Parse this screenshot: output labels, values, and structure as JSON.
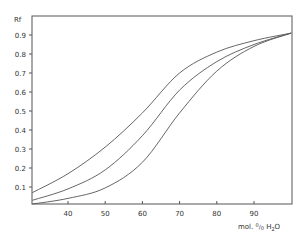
{
  "chart_data": {
    "type": "line",
    "title": "",
    "xlabel": "mol. % H2O",
    "xlabel_display": {
      "pre": "mol. ",
      "percent_top": "0",
      "percent_bottom": "0",
      "post": " H",
      "sub": "2",
      "end": "O"
    },
    "ylabel": "Rf",
    "xlim": [
      30.4,
      100
    ],
    "ylim": [
      0,
      1.0
    ],
    "x_ticks": [
      40,
      50,
      60,
      70,
      80,
      90
    ],
    "x_tick_labels": [
      "40",
      "50",
      "60",
      "70",
      "80",
      "90"
    ],
    "y_ticks": [
      0.1,
      0.2,
      0.3,
      0.4,
      0.5,
      0.6,
      0.7,
      0.8,
      0.9
    ],
    "y_tick_labels": [
      "0.1",
      "0.2",
      "0.3",
      "0.4",
      "0.5",
      "0.6",
      "0.7",
      "0.8",
      "0.9"
    ],
    "grid": false,
    "legend": null,
    "x": [
      30.4,
      40,
      50,
      60,
      70,
      80,
      90,
      100
    ],
    "series": [
      {
        "name": "upper curve",
        "values": [
          0.07,
          0.17,
          0.31,
          0.49,
          0.7,
          0.81,
          0.87,
          0.91
        ]
      },
      {
        "name": "middle curve",
        "values": [
          0.03,
          0.09,
          0.19,
          0.37,
          0.61,
          0.76,
          0.85,
          0.91
        ]
      },
      {
        "name": "lower curve",
        "values": [
          0.0,
          0.04,
          0.095,
          0.23,
          0.49,
          0.71,
          0.84,
          0.91
        ]
      }
    ]
  },
  "labels": {
    "y_axis_title": "Rf"
  }
}
